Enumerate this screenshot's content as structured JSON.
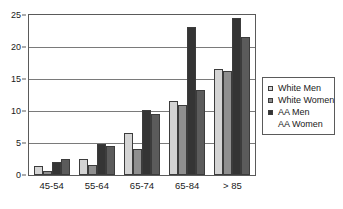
{
  "chart_data": {
    "type": "bar",
    "title": "",
    "subtitle": "",
    "xlabel": "",
    "ylabel": "",
    "categories": [
      "45-54",
      "55-64",
      "65-74",
      "65-84",
      "> 85"
    ],
    "series": [
      {
        "name": "White Men",
        "color": "#d4d4d4",
        "values": [
          1.4,
          2.5,
          6.5,
          11.5,
          16.5
        ]
      },
      {
        "name": "White Women",
        "color": "#8f8f8f",
        "values": [
          0.7,
          1.5,
          4.1,
          11.0,
          16.2
        ]
      },
      {
        "name": "AA Men",
        "color": "#343434",
        "values": [
          2.1,
          4.8,
          10.2,
          23.1,
          24.5
        ]
      },
      {
        "name": "AA Women",
        "color": "#5b5b5b",
        "values": [
          2.5,
          4.5,
          9.6,
          13.3,
          21.5
        ]
      }
    ],
    "ylim": [
      0,
      25
    ],
    "yticks": [
      0,
      5,
      10,
      15,
      20,
      25
    ],
    "ytick_labels": [
      "0",
      "5",
      "10",
      "15",
      "20",
      "25"
    ],
    "grid": true,
    "grid_axis": "y",
    "legend": {
      "position": "right",
      "entries": [
        "White Men",
        "White Women",
        "AA Men",
        "AA Women"
      ]
    }
  }
}
